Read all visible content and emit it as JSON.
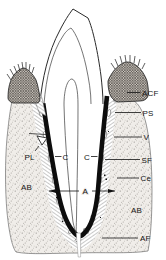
{
  "figure": {
    "background": "#ffffff",
    "ink_color": "#1c1c1c"
  },
  "labels": {
    "acf": "ACF",
    "ps": "PS",
    "v": "V",
    "sf": "SF",
    "ce": "Ce",
    "ab_left": "AB",
    "ab_right": "AB",
    "af": "AF",
    "pl": "PL",
    "c_left": "C",
    "c_right": "C",
    "a": "A"
  }
}
